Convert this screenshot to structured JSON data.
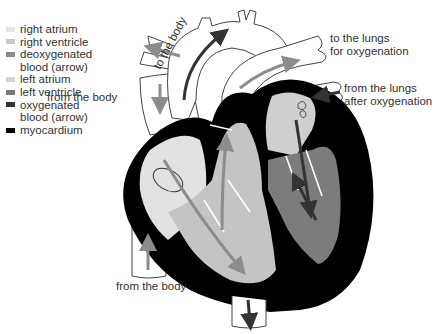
{
  "legend": {
    "items": [
      {
        "label": "right atrium",
        "color": "#e6e6e6"
      },
      {
        "label": "right ventricle",
        "color": "#c8c8c8"
      },
      {
        "label": "deoxygenated",
        "label2": "blood (arrow)",
        "color": "#8a8a8a"
      },
      {
        "label": "left atrium",
        "color": "#d4d4d4"
      },
      {
        "label": "left ventricle",
        "color": "#7a7a7a"
      },
      {
        "label": "oxygenated",
        "label2": "blood (arrow)",
        "color": "#333333"
      },
      {
        "label": "myocardium",
        "color": "#000000"
      }
    ]
  },
  "labels": {
    "to_body": "to the body",
    "from_body_top": "from the body",
    "to_lungs_1": "to the lungs",
    "to_lungs_2": "for oxygenation",
    "from_lungs_1": "from the lungs",
    "from_lungs_2": "after oxygenation",
    "from_body_bottom": "from the body"
  },
  "colors": {
    "myocardium": "#000000",
    "right_atrium": "#e2e2e2",
    "right_ventricle": "#c4c4c4",
    "left_atrium": "#cfcfcf",
    "left_ventricle": "#7c7c7c",
    "deoxy_arrow": "#8c8c8c",
    "oxy_arrow": "#333333",
    "vessel_outline": "#444444"
  }
}
